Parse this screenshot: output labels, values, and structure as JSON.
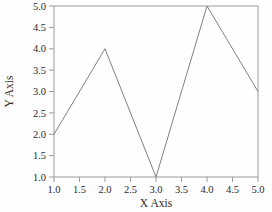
{
  "chart_data": {
    "type": "line",
    "title": "",
    "xlabel": "X Axis",
    "ylabel": "Y Axis",
    "x": [
      1.0,
      2.0,
      3.0,
      4.0,
      5.0
    ],
    "values": [
      2.0,
      4.0,
      1.0,
      5.0,
      3.0
    ],
    "series": [
      {
        "name": "",
        "x": [
          1.0,
          2.0,
          3.0,
          4.0,
          5.0
        ],
        "values": [
          2.0,
          4.0,
          1.0,
          5.0,
          3.0
        ]
      }
    ],
    "xlim": [
      1.0,
      5.0
    ],
    "ylim": [
      1.0,
      5.0
    ],
    "xticks": [
      1.0,
      1.5,
      2.0,
      2.5,
      3.0,
      3.5,
      4.0,
      4.5,
      5.0
    ],
    "yticks": [
      1.0,
      1.5,
      2.0,
      2.5,
      3.0,
      3.5,
      4.0,
      4.5,
      5.0
    ],
    "xticklabels": [
      "1.0",
      "1.5",
      "2.0",
      "2.5",
      "3.0",
      "3.5",
      "4.0",
      "4.5",
      "5.0"
    ],
    "yticklabels": [
      "1.0",
      "1.5",
      "2.0",
      "2.5",
      "3.0",
      "3.5",
      "4.0",
      "4.5",
      "5.0"
    ],
    "grid": false,
    "legend": null,
    "legend_position": "none",
    "markers": false,
    "line_color": "#808080",
    "frame_color": "#9a9a9a",
    "background_color": "#fefefe"
  }
}
